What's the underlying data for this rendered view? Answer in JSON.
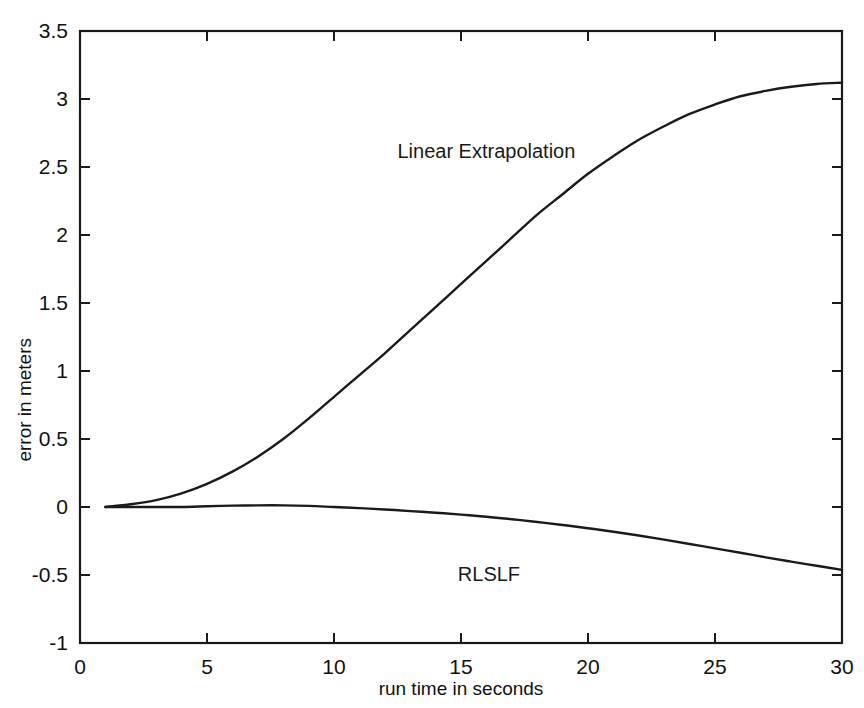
{
  "chart_data": {
    "type": "line",
    "title": "",
    "xlabel": "run time in seconds",
    "ylabel": "error in meters",
    "xlim": [
      0,
      30
    ],
    "ylim": [
      -1,
      3.5
    ],
    "xticks": [
      0,
      5,
      10,
      15,
      20,
      25,
      30
    ],
    "xtick_labels": [
      "0",
      "5",
      "10",
      "15",
      "20",
      "25",
      "30"
    ],
    "yticks": [
      -1,
      -0.5,
      0,
      0.5,
      1,
      1.5,
      2,
      2.5,
      3,
      3.5
    ],
    "ytick_labels": [
      "-1",
      "-0.5",
      "0",
      "0.5",
      "1",
      "1.5",
      "2",
      "2.5",
      "3",
      "3.5"
    ],
    "grid": false,
    "legend": "inline-annotations",
    "line_color": "#1a1a1a",
    "background": "#ffffff",
    "annotations": [
      {
        "text": "Linear Extrapolation",
        "x": 16.0,
        "y": 2.62
      },
      {
        "text": "RLSLF",
        "x": 16.1,
        "y": -0.49
      }
    ],
    "x": [
      1,
      2,
      3,
      4,
      5,
      6,
      7,
      8,
      9,
      10,
      11,
      12,
      13,
      14,
      15,
      16,
      17,
      18,
      19,
      20,
      21,
      22,
      23,
      24,
      25,
      26,
      27,
      28,
      29,
      30
    ],
    "series": [
      {
        "name": "Linear Extrapolation",
        "values": [
          0.0,
          0.02,
          0.05,
          0.1,
          0.17,
          0.26,
          0.37,
          0.5,
          0.65,
          0.81,
          0.97,
          1.13,
          1.3,
          1.47,
          1.64,
          1.81,
          1.98,
          2.15,
          2.3,
          2.45,
          2.58,
          2.7,
          2.8,
          2.89,
          2.96,
          3.02,
          3.06,
          3.09,
          3.11,
          3.12
        ]
      },
      {
        "name": "RLSLF",
        "values": [
          0.0,
          0.0,
          0.0,
          0.0,
          0.005,
          0.01,
          0.012,
          0.012,
          0.008,
          0.0,
          -0.008,
          -0.018,
          -0.03,
          -0.042,
          -0.056,
          -0.072,
          -0.09,
          -0.11,
          -0.132,
          -0.156,
          -0.182,
          -0.21,
          -0.24,
          -0.272,
          -0.304,
          -0.336,
          -0.37,
          -0.402,
          -0.432,
          -0.462
        ]
      }
    ]
  },
  "axis": {
    "ylabel": "error in meters",
    "xlabel": "run time in seconds"
  }
}
